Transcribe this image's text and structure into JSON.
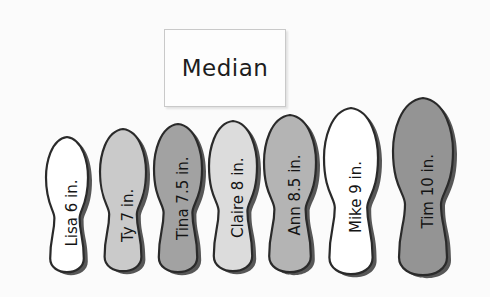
{
  "figure": {
    "background_color": "#fbfbfb",
    "width": 490,
    "height": 297,
    "type": "pictograph-foot-length-diagram"
  },
  "callout": {
    "label": "Median",
    "box_fill": "#fdfdfd",
    "box_border": "#c9c9c9",
    "points_to": "Claire 8 in."
  },
  "chart_data": {
    "type": "bar",
    "title": "Median",
    "xlabel": "",
    "ylabel": "Foot length (in.)",
    "categories": [
      "Lisa",
      "Ty",
      "Tina",
      "Claire",
      "Ann",
      "Mike",
      "Tim"
    ],
    "values": [
      6,
      7,
      7.5,
      8,
      8.5,
      9,
      10
    ],
    "units": "in.",
    "median_index": 3,
    "median_value": 8,
    "grid": false,
    "legend": "none"
  },
  "feet": [
    {
      "name": "Lisa",
      "length": "6 in.",
      "label": "Lisa 6 in.",
      "fill": "#ffffff",
      "outline": "#2a2a2a",
      "cx": 67,
      "top": 137,
      "bottom": 272,
      "half_width": 21,
      "is_median": false
    },
    {
      "name": "Ty",
      "length": "7 in.",
      "label": "Ty 7 in.",
      "fill": "#cacaca",
      "outline": "#2a2a2a",
      "cx": 123,
      "top": 129,
      "bottom": 271,
      "half_width": 23,
      "is_median": false
    },
    {
      "name": "Tina",
      "length": "7.5 in.",
      "label": "Tina 7.5 in.",
      "fill": "#a2a2a2",
      "outline": "#2a2a2a",
      "cx": 178,
      "top": 124,
      "bottom": 272,
      "half_width": 24,
      "is_median": false
    },
    {
      "name": "Claire",
      "length": "8 in.",
      "label": "Claire 8 in.",
      "fill": "#dcdcdc",
      "outline": "#2a2a2a",
      "cx": 233,
      "top": 121,
      "bottom": 271,
      "half_width": 24,
      "is_median": true
    },
    {
      "name": "Ann",
      "length": "8.5 in.",
      "label": "Ann 8.5 in.",
      "fill": "#b4b4b4",
      "outline": "#2a2a2a",
      "cx": 290,
      "top": 115,
      "bottom": 272,
      "half_width": 26,
      "is_median": false
    },
    {
      "name": "Mike",
      "length": "9 in.",
      "label": "Mike 9 in.",
      "fill": "#ffffff",
      "outline": "#2a2a2a",
      "cx": 351,
      "top": 108,
      "bottom": 274,
      "half_width": 27,
      "is_median": false
    },
    {
      "name": "Tim",
      "length": "10 in.",
      "label": "Tim 10 in.",
      "fill": "#949494",
      "outline": "#2a2a2a",
      "cx": 423,
      "top": 98,
      "bottom": 275,
      "half_width": 30,
      "is_median": false
    }
  ]
}
